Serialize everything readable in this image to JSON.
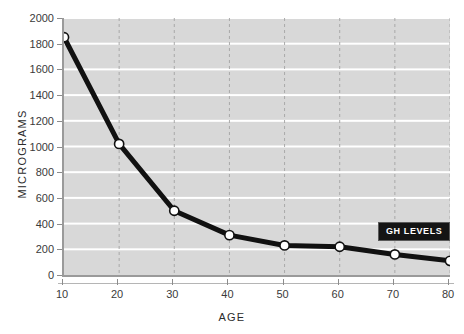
{
  "title": "",
  "axes": {
    "x_title": "AGE",
    "y_title": "MICROGRAMS"
  },
  "legend": {
    "badge_label": "GH LEVELS"
  },
  "ticks": {
    "y": [
      "2000",
      "1800",
      "1600",
      "1400",
      "1200",
      "1000",
      "800",
      "600",
      "400",
      "200",
      "0"
    ],
    "x": [
      "10",
      "20",
      "30",
      "40",
      "50",
      "60",
      "70",
      "80"
    ]
  },
  "colors": {
    "plot_background": "#d8d8d8",
    "gridline": "#ffffff",
    "vertical_gridline": "#a9a9a9",
    "line": "#111111",
    "marker_fill": "#ffffff",
    "marker_stroke": "#111111",
    "axis": "#9a9a9a",
    "badge_background": "#141414",
    "badge_text": "#ffffff"
  },
  "chart_data": {
    "type": "line",
    "title": "",
    "xlabel": "AGE",
    "ylabel": "MICROGRAMS",
    "xlim": [
      10,
      80
    ],
    "ylim": [
      0,
      2000
    ],
    "xticks": [
      10,
      20,
      30,
      40,
      50,
      60,
      70,
      80
    ],
    "yticks": [
      0,
      200,
      400,
      600,
      800,
      1000,
      1200,
      1400,
      1600,
      1800,
      2000
    ],
    "grid": true,
    "legend_position": "inside-right",
    "series": [
      {
        "name": "GH LEVELS",
        "x": [
          10,
          20,
          30,
          40,
          50,
          60,
          70,
          80
        ],
        "values": [
          1850,
          1020,
          500,
          310,
          230,
          220,
          160,
          110
        ]
      }
    ]
  }
}
